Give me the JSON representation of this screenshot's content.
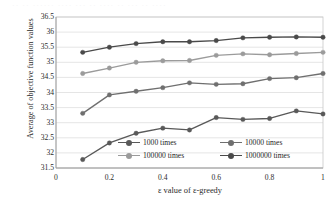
{
  "artifact": {
    "top_bleed_text": "·· ·· ······ ···· ··· ·· ···· ·· ··· ·· ····"
  },
  "chart_data": {
    "type": "line",
    "title": "",
    "subtitle": "",
    "xlabel": "ε value of ε-greedy",
    "ylabel": "Average of objective function values",
    "x": [
      0.1,
      0.2,
      0.3,
      0.4,
      0.5,
      0.6,
      0.7,
      0.8,
      0.9,
      1.0
    ],
    "xlim": [
      0,
      1
    ],
    "ylim": [
      31.5,
      36.5
    ],
    "xticks": [
      "0",
      "0.2",
      "0.4",
      "0.6",
      "0.8",
      "1"
    ],
    "xtick_values": [
      0,
      0.2,
      0.4,
      0.6,
      0.8,
      1
    ],
    "yticks": [
      "31.5",
      "32",
      "32.5",
      "33",
      "33.5",
      "34",
      "34.5",
      "35",
      "35.5",
      "36",
      "36.5"
    ],
    "ytick_values": [
      31.5,
      32,
      32.5,
      33,
      33.5,
      34,
      34.5,
      35,
      35.5,
      36,
      36.5
    ],
    "grid": "horizontal",
    "legend_position": "inside-bottom-center",
    "marker": "circle",
    "series": [
      {
        "name": "1000 times",
        "color": "#595959",
        "values": [
          31.78,
          32.33,
          32.65,
          32.82,
          32.76,
          33.17,
          33.11,
          33.14,
          33.39,
          33.29
        ]
      },
      {
        "name": "10000 times",
        "color": "#6f6f6f",
        "values": [
          33.31,
          33.92,
          34.04,
          34.16,
          34.32,
          34.27,
          34.29,
          34.46,
          34.49,
          34.63
        ]
      },
      {
        "name": "100000 times",
        "color": "#9b9b9b",
        "values": [
          34.63,
          34.81,
          35.0,
          35.05,
          35.06,
          35.23,
          35.28,
          35.25,
          35.29,
          35.33
        ]
      },
      {
        "name": "1000000 times",
        "color": "#4a4a4a",
        "values": [
          35.33,
          35.5,
          35.62,
          35.68,
          35.68,
          35.72,
          35.81,
          35.83,
          35.84,
          35.83
        ]
      }
    ]
  }
}
